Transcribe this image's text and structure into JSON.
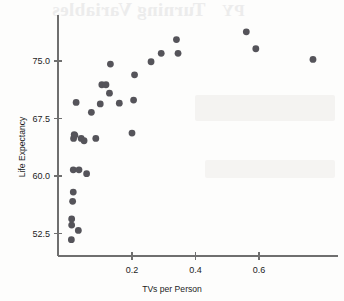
{
  "figure": {
    "background_color": "#fdfdfc",
    "ink_color": "#55545a",
    "axis_color": "#6f6f6f"
  },
  "bleed_through": {
    "title_text": "Turning Variables",
    "mark_text": "PY"
  },
  "chart_data": {
    "type": "scatter",
    "title": "",
    "xlabel": "TVs per Person",
    "ylabel": "Life Expectancy",
    "xlim": [
      0.0,
      0.81
    ],
    "ylim": [
      50.5,
      79.5
    ],
    "xticks": [
      0.2,
      0.4,
      0.6
    ],
    "xticklabels": [
      "0.2",
      "0.4",
      "0.6"
    ],
    "yticks": [
      52.5,
      60.0,
      67.5,
      75.0
    ],
    "yticklabels": [
      "52.5",
      "60.0",
      "67.5",
      "75.0"
    ],
    "grid": false,
    "legend": null,
    "marker": "circle",
    "marker_size": 3.4,
    "marker_color": "#55545a",
    "series": [
      {
        "name": "Countries",
        "points": [
          [
            0.009,
            51.7
          ],
          [
            0.01,
            53.6
          ],
          [
            0.01,
            54.4
          ],
          [
            0.013,
            56.7
          ],
          [
            0.015,
            57.9
          ],
          [
            0.015,
            60.8
          ],
          [
            0.016,
            64.9
          ],
          [
            0.018,
            65.4
          ],
          [
            0.02,
            65.3
          ],
          [
            0.024,
            69.6
          ],
          [
            0.031,
            52.9
          ],
          [
            0.033,
            60.8
          ],
          [
            0.04,
            64.9
          ],
          [
            0.049,
            64.6
          ],
          [
            0.057,
            60.3
          ],
          [
            0.072,
            68.3
          ],
          [
            0.086,
            64.9
          ],
          [
            0.1,
            69.4
          ],
          [
            0.105,
            71.9
          ],
          [
            0.118,
            71.9
          ],
          [
            0.129,
            70.8
          ],
          [
            0.132,
            74.6
          ],
          [
            0.16,
            69.5
          ],
          [
            0.2,
            65.6
          ],
          [
            0.205,
            69.9
          ],
          [
            0.208,
            73.2
          ],
          [
            0.26,
            74.9
          ],
          [
            0.292,
            76.0
          ],
          [
            0.34,
            77.8
          ],
          [
            0.345,
            76.0
          ],
          [
            0.56,
            78.8
          ],
          [
            0.59,
            76.6
          ],
          [
            0.77,
            75.2
          ]
        ]
      }
    ]
  },
  "geometry": {
    "x_pixel_at_zero": 68.5,
    "x_pixels_per_unit": 317.5,
    "y_pixel_at_75": 61.0,
    "y_pixels_per_unit": 7.6667,
    "axis_y_top": 15,
    "axis_y_bottom": 256,
    "axis_x_left": 58,
    "axis_x_right": 338
  }
}
